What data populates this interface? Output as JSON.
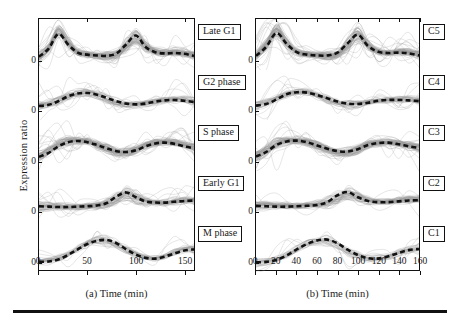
{
  "figure": {
    "y_axis_label": "Expression ratio",
    "y_zero_tick": "0",
    "panels": [
      {
        "id": "a",
        "caption": "(a) Time (min)",
        "x_ticks": [
          "0",
          "50",
          "100",
          "150"
        ],
        "x_tick_values": [
          0,
          50,
          100,
          150
        ],
        "x_range": [
          0,
          160
        ],
        "cluster_labels": [
          "Late G1",
          "G2 phase",
          "S phase",
          "Early G1",
          "M phase"
        ]
      },
      {
        "id": "b",
        "caption": "(b) Time (min)",
        "x_ticks": [
          "0",
          "20",
          "40",
          "60",
          "80",
          "100",
          "120",
          "140",
          "160"
        ],
        "x_tick_values": [
          0,
          20,
          40,
          60,
          80,
          100,
          120,
          140,
          160
        ],
        "x_range": [
          0,
          160
        ],
        "cluster_labels": [
          "C5",
          "C4",
          "C3",
          "C2",
          "C1"
        ]
      }
    ]
  },
  "colors": {
    "member_curve": "#9a9a9a",
    "centroid": "#111111",
    "frame": "#111111",
    "background": "#ffffff"
  },
  "chart_data": {
    "type": "line",
    "title": "",
    "xlabel": "Time (min)",
    "ylabel": "Expression ratio",
    "xlim": [
      0,
      160
    ],
    "grid": false,
    "legend_position": "right-of-panel",
    "panels": [
      {
        "panel": "a",
        "xticks": [
          0,
          50,
          100,
          150
        ],
        "subpanels": [
          {
            "label": "Late G1",
            "x": [
              0,
              10,
              20,
              30,
              40,
              50,
              60,
              70,
              80,
              90,
              100,
              110,
              120,
              130,
              140,
              150,
              160
            ],
            "centroid": [
              0.22,
              0.42,
              0.78,
              0.52,
              0.32,
              0.27,
              0.25,
              0.24,
              0.3,
              0.52,
              0.74,
              0.46,
              0.33,
              0.3,
              0.31,
              0.29,
              0.24
            ],
            "band_halfwidth": [
              0.1,
              0.14,
              0.2,
              0.16,
              0.1,
              0.08,
              0.08,
              0.08,
              0.1,
              0.16,
              0.19,
              0.15,
              0.1,
              0.09,
              0.09,
              0.09,
              0.09
            ],
            "n_members": 60
          },
          {
            "label": "G2 phase",
            "x": [
              0,
              10,
              20,
              30,
              40,
              50,
              60,
              70,
              80,
              90,
              100,
              110,
              120,
              130,
              140,
              150,
              160
            ],
            "centroid": [
              0.26,
              0.29,
              0.38,
              0.5,
              0.57,
              0.58,
              0.54,
              0.46,
              0.38,
              0.32,
              0.3,
              0.32,
              0.37,
              0.4,
              0.41,
              0.39,
              0.36
            ],
            "band_halfwidth": [
              0.09,
              0.09,
              0.1,
              0.11,
              0.11,
              0.1,
              0.1,
              0.09,
              0.09,
              0.09,
              0.08,
              0.08,
              0.09,
              0.09,
              0.09,
              0.09,
              0.09
            ],
            "n_members": 35
          },
          {
            "label": "S phase",
            "x": [
              0,
              10,
              20,
              30,
              40,
              50,
              60,
              70,
              80,
              90,
              100,
              110,
              120,
              130,
              140,
              150,
              160
            ],
            "centroid": [
              0.24,
              0.34,
              0.5,
              0.6,
              0.63,
              0.6,
              0.53,
              0.45,
              0.38,
              0.36,
              0.4,
              0.5,
              0.57,
              0.59,
              0.56,
              0.5,
              0.45
            ],
            "band_halfwidth": [
              0.1,
              0.13,
              0.15,
              0.14,
              0.12,
              0.11,
              0.1,
              0.09,
              0.09,
              0.09,
              0.1,
              0.11,
              0.11,
              0.1,
              0.1,
              0.1,
              0.1
            ],
            "n_members": 55
          },
          {
            "label": "Early G1",
            "x": [
              0,
              10,
              20,
              30,
              40,
              50,
              60,
              70,
              80,
              90,
              100,
              110,
              120,
              130,
              140,
              150,
              160
            ],
            "centroid": [
              0.28,
              0.27,
              0.26,
              0.26,
              0.27,
              0.28,
              0.3,
              0.36,
              0.52,
              0.62,
              0.5,
              0.4,
              0.37,
              0.37,
              0.39,
              0.41,
              0.42
            ],
            "band_halfwidth": [
              0.09,
              0.09,
              0.09,
              0.09,
              0.09,
              0.09,
              0.1,
              0.12,
              0.16,
              0.17,
              0.13,
              0.1,
              0.09,
              0.09,
              0.09,
              0.09,
              0.09
            ],
            "n_members": 45
          },
          {
            "label": "M phase",
            "x": [
              0,
              10,
              20,
              30,
              40,
              50,
              60,
              70,
              80,
              90,
              100,
              110,
              120,
              130,
              140,
              150,
              160
            ],
            "centroid": [
              0.14,
              0.15,
              0.2,
              0.31,
              0.45,
              0.58,
              0.66,
              0.68,
              0.6,
              0.45,
              0.32,
              0.24,
              0.22,
              0.27,
              0.35,
              0.42,
              0.45
            ],
            "band_halfwidth": [
              0.07,
              0.07,
              0.08,
              0.1,
              0.12,
              0.12,
              0.12,
              0.12,
              0.12,
              0.11,
              0.09,
              0.08,
              0.08,
              0.09,
              0.1,
              0.1,
              0.1
            ],
            "n_members": 28
          }
        ]
      },
      {
        "panel": "b",
        "xticks": [
          0,
          20,
          40,
          60,
          80,
          100,
          120,
          140,
          160
        ],
        "subpanels": [
          {
            "label": "C5",
            "x": [
              0,
              10,
              20,
              30,
              40,
              50,
              60,
              70,
              80,
              90,
              100,
              110,
              120,
              130,
              140,
              150,
              160
            ],
            "centroid": [
              0.24,
              0.46,
              0.8,
              0.54,
              0.33,
              0.27,
              0.25,
              0.25,
              0.32,
              0.55,
              0.76,
              0.48,
              0.34,
              0.31,
              0.32,
              0.3,
              0.25
            ],
            "band_halfwidth": [
              0.1,
              0.15,
              0.21,
              0.16,
              0.1,
              0.08,
              0.08,
              0.08,
              0.1,
              0.17,
              0.2,
              0.15,
              0.1,
              0.09,
              0.09,
              0.09,
              0.09
            ],
            "n_members": 62
          },
          {
            "label": "C4",
            "x": [
              0,
              10,
              20,
              30,
              40,
              50,
              60,
              70,
              80,
              90,
              100,
              110,
              120,
              130,
              140,
              150,
              160
            ],
            "centroid": [
              0.27,
              0.31,
              0.42,
              0.55,
              0.6,
              0.59,
              0.53,
              0.45,
              0.37,
              0.32,
              0.31,
              0.34,
              0.39,
              0.41,
              0.41,
              0.4,
              0.38
            ],
            "band_halfwidth": [
              0.09,
              0.1,
              0.11,
              0.11,
              0.11,
              0.1,
              0.1,
              0.09,
              0.09,
              0.09,
              0.08,
              0.08,
              0.09,
              0.09,
              0.09,
              0.09,
              0.09
            ],
            "n_members": 33
          },
          {
            "label": "C3",
            "x": [
              0,
              10,
              20,
              30,
              40,
              50,
              60,
              70,
              80,
              90,
              100,
              110,
              120,
              130,
              140,
              150,
              160
            ],
            "centroid": [
              0.25,
              0.36,
              0.53,
              0.62,
              0.64,
              0.6,
              0.52,
              0.44,
              0.38,
              0.37,
              0.43,
              0.53,
              0.58,
              0.59,
              0.55,
              0.5,
              0.46
            ],
            "band_halfwidth": [
              0.1,
              0.13,
              0.15,
              0.14,
              0.12,
              0.11,
              0.1,
              0.09,
              0.09,
              0.09,
              0.1,
              0.11,
              0.11,
              0.1,
              0.1,
              0.1,
              0.1
            ],
            "n_members": 57
          },
          {
            "label": "C2",
            "x": [
              0,
              10,
              20,
              30,
              40,
              50,
              60,
              70,
              80,
              90,
              100,
              110,
              120,
              130,
              140,
              150,
              160
            ],
            "centroid": [
              0.29,
              0.28,
              0.27,
              0.27,
              0.28,
              0.29,
              0.31,
              0.38,
              0.55,
              0.63,
              0.5,
              0.41,
              0.38,
              0.38,
              0.4,
              0.42,
              0.43
            ],
            "band_halfwidth": [
              0.09,
              0.09,
              0.09,
              0.09,
              0.09,
              0.09,
              0.1,
              0.13,
              0.17,
              0.18,
              0.13,
              0.1,
              0.09,
              0.09,
              0.09,
              0.09,
              0.09
            ],
            "n_members": 44
          },
          {
            "label": "C1",
            "x": [
              0,
              10,
              20,
              30,
              40,
              50,
              60,
              70,
              80,
              90,
              100,
              110,
              120,
              130,
              140,
              150,
              160
            ],
            "centroid": [
              0.13,
              0.14,
              0.19,
              0.3,
              0.45,
              0.58,
              0.67,
              0.69,
              0.6,
              0.44,
              0.31,
              0.23,
              0.22,
              0.28,
              0.36,
              0.43,
              0.46
            ],
            "band_halfwidth": [
              0.07,
              0.07,
              0.08,
              0.1,
              0.12,
              0.12,
              0.12,
              0.12,
              0.12,
              0.11,
              0.09,
              0.08,
              0.08,
              0.09,
              0.1,
              0.1,
              0.1
            ],
            "n_members": 26
          }
        ]
      }
    ]
  }
}
